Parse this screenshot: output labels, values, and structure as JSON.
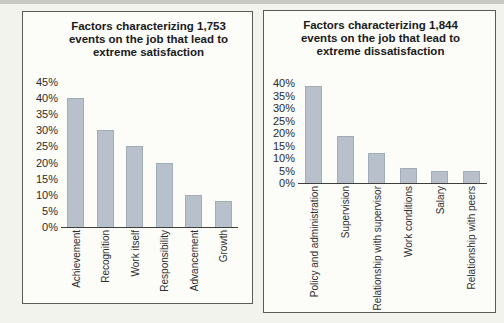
{
  "page": {
    "background": "#f3f3ee",
    "scan_band_color": "#c7c8c4"
  },
  "colors": {
    "bar_fill": "#b8c1cb",
    "bar_edge": "#a2acb7",
    "axis_line": "#3e3e3b",
    "panel_border": "#5c5b55",
    "panel_bg": "#fcfcf9",
    "text": "#1a1a1a"
  },
  "chart_data": [
    {
      "type": "bar",
      "title": "Factors characterizing 1,753 events on the job that lead to extreme satisfaction",
      "title_lines": [
        "Factors characterizing 1,753",
        "events on the job that lead to",
        "extreme satisfaction"
      ],
      "categories": [
        "Achievement",
        "Recognition",
        "Work itself",
        "Responsibility",
        "Advancement",
        "Growth"
      ],
      "values": [
        40,
        30,
        25,
        20,
        10,
        8
      ],
      "value_unit": "percent",
      "xlabel": "",
      "ylabel": "",
      "ylim": [
        0,
        45
      ],
      "ytick_step": 5,
      "ytick_suffix": "%",
      "grid": false,
      "legend": "none",
      "x_labels_rotated": true
    },
    {
      "type": "bar",
      "title": "Factors characterizing 1,844 events on the job that lead to extreme dissatisfaction",
      "title_lines": [
        "Factors characterizing 1,844",
        "events on the job that lead to",
        "extreme dissatisfaction"
      ],
      "categories": [
        "Policy and administration",
        "Supervision",
        "Relationship with supervisor",
        "Work conditions",
        "Salary",
        "Relationship with peers"
      ],
      "values": [
        39,
        19,
        12,
        6,
        5,
        5
      ],
      "value_unit": "percent",
      "xlabel": "",
      "ylabel": "",
      "ylim": [
        0,
        40
      ],
      "ytick_step": 5,
      "ytick_suffix": "%",
      "grid": false,
      "legend": "none",
      "x_labels_rotated": true
    }
  ]
}
